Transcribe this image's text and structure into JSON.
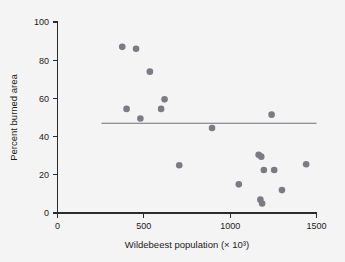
{
  "chart_data": {
    "type": "scatter",
    "title": "",
    "xlabel": "Wildebeest population (× 10³)",
    "ylabel": "Percent burned area",
    "xlim": [
      0,
      1500
    ],
    "ylim": [
      0,
      100
    ],
    "xticks": [
      0,
      500,
      1000,
      1500
    ],
    "yticks": [
      0,
      20,
      40,
      60,
      80,
      100
    ],
    "xtick_labels": [
      "0",
      "500",
      "1000",
      "1500"
    ],
    "ytick_labels": [
      "0",
      "20",
      "40",
      "60",
      "80",
      "100"
    ],
    "grid": false,
    "legend": null,
    "marker_color": "#7b7b83",
    "fit_line_color": "#6f6f77",
    "axis_color": "#2b2b2b",
    "background_color": "#f4f4f4",
    "series": [
      {
        "name": "Observations",
        "points": [
          {
            "x": 375,
            "y": 87
          },
          {
            "x": 455,
            "y": 86
          },
          {
            "x": 535,
            "y": 74
          },
          {
            "x": 620,
            "y": 59.5
          },
          {
            "x": 400,
            "y": 54.5
          },
          {
            "x": 600,
            "y": 54.5
          },
          {
            "x": 480,
            "y": 49.5
          },
          {
            "x": 1240,
            "y": 51.5
          },
          {
            "x": 895,
            "y": 44.5
          },
          {
            "x": 1165,
            "y": 30.5
          },
          {
            "x": 1180,
            "y": 29.5
          },
          {
            "x": 1440,
            "y": 25.5
          },
          {
            "x": 705,
            "y": 25
          },
          {
            "x": 1195,
            "y": 22.5
          },
          {
            "x": 1255,
            "y": 22.5
          },
          {
            "x": 1050,
            "y": 15
          },
          {
            "x": 1300,
            "y": 12
          },
          {
            "x": 1175,
            "y": 7
          },
          {
            "x": 1185,
            "y": 5
          }
        ]
      }
    ],
    "fit_line": {
      "type": "horizontal",
      "y_value": 47,
      "x_start": 255,
      "x_end": 1500
    }
  }
}
